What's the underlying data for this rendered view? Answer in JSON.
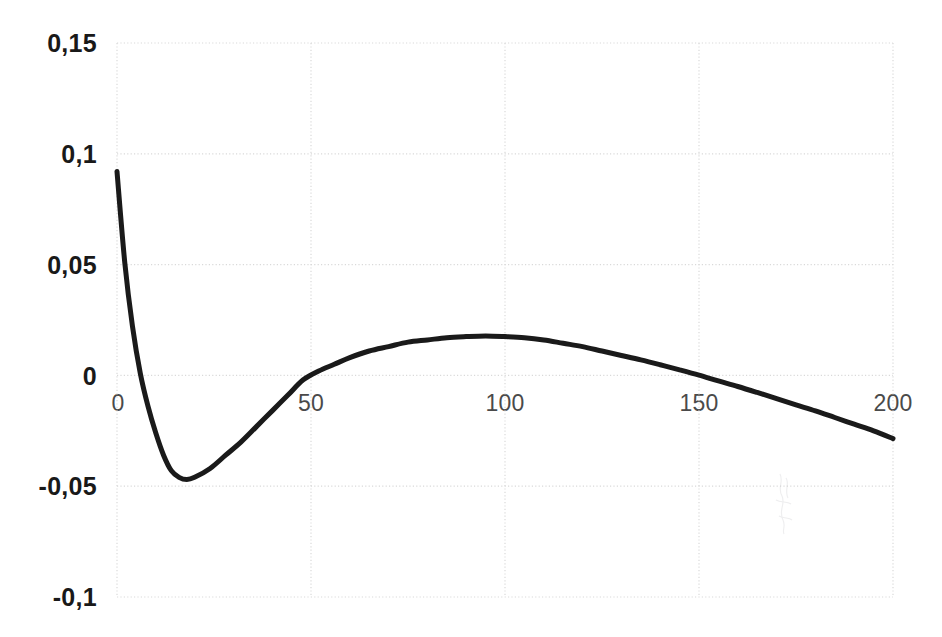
{
  "chart_data": {
    "type": "line",
    "title": "",
    "subtitle": "",
    "xlabel": "",
    "ylabel": "",
    "xlim": [
      0,
      200
    ],
    "ylim": [
      -0.1,
      0.15
    ],
    "grid": true,
    "legend": null,
    "decimal_separator": ",",
    "line_color": "#1a1a1a",
    "line_width_px": 5,
    "gridline_color": "#d9d9d9",
    "gridline_style": "dotted",
    "x_ticks": [
      0,
      50,
      100,
      150,
      200
    ],
    "x_tick_labels": [
      "0",
      "50",
      "100",
      "150",
      "200"
    ],
    "y_ticks": [
      -0.1,
      -0.05,
      0,
      0.05,
      0.1,
      0.15
    ],
    "y_tick_labels": [
      "-0,1",
      "-0,05",
      "0",
      "0,05",
      "0,1",
      "0,15"
    ],
    "series": [
      {
        "name": "curve",
        "x": [
          0,
          2,
          4,
          6,
          8,
          10,
          12,
          14,
          16,
          18,
          20,
          24,
          28,
          32,
          36,
          40,
          44,
          48,
          52,
          56,
          60,
          65,
          70,
          75,
          80,
          85,
          90,
          95,
          100,
          105,
          110,
          115,
          120,
          125,
          130,
          135,
          140,
          145,
          150,
          155,
          160,
          165,
          170,
          175,
          180,
          185,
          190,
          195,
          200
        ],
        "y": [
          0.092,
          0.051,
          0.022,
          0.001,
          -0.014,
          -0.026,
          -0.036,
          -0.043,
          -0.046,
          -0.047,
          -0.046,
          -0.042,
          -0.036,
          -0.03,
          -0.023,
          -0.016,
          -0.009,
          -0.002,
          0.002,
          0.005,
          0.008,
          0.011,
          0.013,
          0.015,
          0.016,
          0.017,
          0.0175,
          0.0178,
          0.0175,
          0.017,
          0.016,
          0.0145,
          0.013,
          0.011,
          0.009,
          0.007,
          0.0048,
          0.0025,
          0.0001,
          -0.0025,
          -0.005,
          -0.0077,
          -0.0105,
          -0.0133,
          -0.016,
          -0.019,
          -0.022,
          -0.025,
          -0.0285
        ]
      }
    ],
    "annotations": {
      "minimum": {
        "x": 13,
        "y": -0.047
      },
      "maximum": {
        "x": 95,
        "y": 0.0178
      },
      "zero_crossings": [
        48,
        151
      ],
      "start_point": {
        "x": 0,
        "y": 0.092
      },
      "end_point": {
        "x": 200,
        "y": -0.0285
      }
    }
  },
  "axes": {
    "y_labels": [
      {
        "text": "0,15",
        "value": 0.15
      },
      {
        "text": "0,1",
        "value": 0.1
      },
      {
        "text": "0,05",
        "value": 0.05
      },
      {
        "text": "0",
        "value": 0
      },
      {
        "text": "-0,05",
        "value": -0.05
      },
      {
        "text": "-0,1",
        "value": -0.1
      }
    ],
    "x_labels": [
      {
        "text": "0",
        "value": 0
      },
      {
        "text": "50",
        "value": 50
      },
      {
        "text": "100",
        "value": 100
      },
      {
        "text": "150",
        "value": 150
      },
      {
        "text": "200",
        "value": 200
      }
    ]
  },
  "plot_geometry": {
    "left": 117,
    "right": 893,
    "top": 43,
    "bottom": 597
  }
}
